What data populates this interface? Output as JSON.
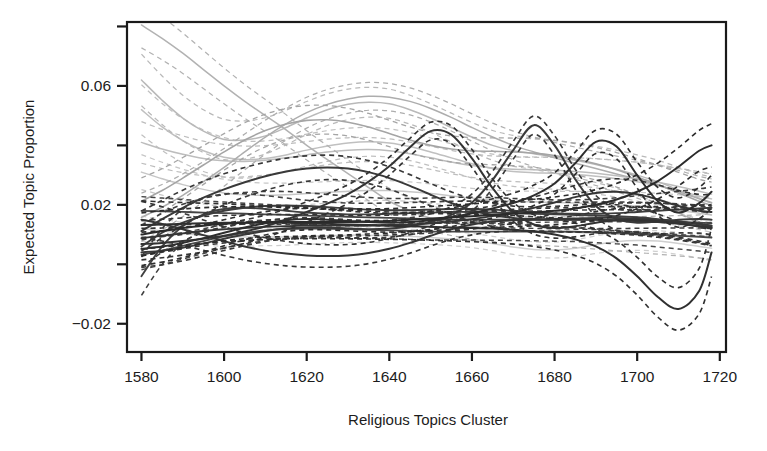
{
  "chart_data": {
    "type": "line",
    "title": "",
    "xlabel": "Religious Topics Cluster",
    "ylabel": "Expected Topic Proportion",
    "xlim": [
      1576.5,
      1721.5
    ],
    "ylim": [
      -0.0295,
      0.0815
    ],
    "grid": false,
    "legend": "none",
    "x_ticks": [
      1580,
      1600,
      1620,
      1640,
      1660,
      1680,
      1700,
      1720
    ],
    "x_tick_labels": [
      "1580",
      "1600",
      "1620",
      "1640",
      "1660",
      "1680",
      "1700",
      "1720"
    ],
    "y_ticks": [
      -0.02,
      0.0,
      0.02,
      0.04,
      0.06,
      0.08
    ],
    "y_tick_labels": [
      "-0.02",
      "",
      "0.02",
      "",
      "0.06",
      ""
    ],
    "x": [
      1580,
      1585,
      1590,
      1595,
      1600,
      1605,
      1610,
      1615,
      1620,
      1625,
      1630,
      1635,
      1640,
      1645,
      1650,
      1655,
      1660,
      1665,
      1670,
      1675,
      1680,
      1685,
      1690,
      1695,
      1700,
      1705,
      1710,
      1715,
      1718
    ],
    "ci_style": "dashed",
    "series": [
      {
        "name": "topic-1-light-declining",
        "color": "#b2b2b2",
        "width": 1.5,
        "ci_halfwidth": 0.0055,
        "values": [
          0.0805,
          0.076,
          0.071,
          0.0655,
          0.06,
          0.0548,
          0.05,
          0.0452,
          0.04,
          0.0352,
          0.0305,
          0.0258,
          0.0212,
          0.018,
          0.0155,
          0.014,
          0.0128,
          0.012,
          0.0115,
          0.0112,
          0.011,
          0.0108,
          0.0105,
          0.0102,
          0.01,
          0.0098,
          0.0096,
          0.0094,
          0.0093
        ]
      },
      {
        "name": "topic-2-light-hump",
        "color": "#b9b9b9",
        "width": 1.5,
        "ci_halfwidth": 0.0062,
        "values": [
          0.062,
          0.0552,
          0.0492,
          0.0448,
          0.042,
          0.0418,
          0.0432,
          0.046,
          0.0492,
          0.052,
          0.0538,
          0.0545,
          0.054,
          0.052,
          0.0492,
          0.046,
          0.0428,
          0.04,
          0.0382,
          0.0372,
          0.0362,
          0.035,
          0.0336,
          0.032,
          0.03,
          0.0278,
          0.025,
          0.0222,
          0.0208
        ]
      },
      {
        "name": "topic-3-light-rising",
        "color": "#adadad",
        "width": 1.5,
        "ci_halfwidth": 0.0058,
        "values": [
          0.0158,
          0.0192,
          0.0232,
          0.0278,
          0.0326,
          0.0378,
          0.0428,
          0.0472,
          0.051,
          0.0538,
          0.0556,
          0.0565,
          0.0562,
          0.0548,
          0.0524,
          0.0494,
          0.046,
          0.0428,
          0.04,
          0.0378,
          0.0358,
          0.034,
          0.0322,
          0.0304,
          0.0286,
          0.0266,
          0.0244,
          0.022,
          0.0206
        ]
      },
      {
        "name": "topic-4-light-valley",
        "color": "#c0c0c0",
        "width": 1.5,
        "ci_halfwidth": 0.006,
        "values": [
          0.052,
          0.0462,
          0.0416,
          0.0382,
          0.036,
          0.0352,
          0.0356,
          0.0368,
          0.0384,
          0.0398,
          0.0408,
          0.0412,
          0.0408,
          0.0396,
          0.0378,
          0.0358,
          0.0338,
          0.0322,
          0.0312,
          0.0308,
          0.0306,
          0.0302,
          0.0296,
          0.0288,
          0.0278,
          0.0264,
          0.0248,
          0.023,
          0.022
        ]
      },
      {
        "name": "topic-5-light-flat-low",
        "color": "#c6c6c6",
        "width": 1.5,
        "ci_halfwidth": 0.0042,
        "values": [
          0.031,
          0.0288,
          0.0268,
          0.0252,
          0.024,
          0.0234,
          0.0232,
          0.0234,
          0.0238,
          0.0242,
          0.0246,
          0.0248,
          0.0248,
          0.0244,
          0.0238,
          0.023,
          0.0222,
          0.0216,
          0.0212,
          0.021,
          0.0208,
          0.0206,
          0.0204,
          0.02,
          0.0196,
          0.019,
          0.0182,
          0.0172,
          0.0166
        ]
      },
      {
        "name": "topic-6-light-midgray-rise",
        "color": "#a5a5a5",
        "width": 1.6,
        "ci_halfwidth": 0.0056,
        "values": [
          0.0212,
          0.0248,
          0.029,
          0.0334,
          0.0378,
          0.0418,
          0.045,
          0.0472,
          0.0484,
          0.0486,
          0.0478,
          0.0462,
          0.044,
          0.0418,
          0.04,
          0.0388,
          0.0382,
          0.038,
          0.0378,
          0.0374,
          0.0366,
          0.0354,
          0.0338,
          0.0318,
          0.0294,
          0.0268,
          0.024,
          0.0212,
          0.0198
        ]
      },
      {
        "name": "topic-7-dark-peak-1652",
        "color": "#333333",
        "width": 2.0,
        "ci_halfwidth": 0.0038,
        "values": [
          0.0068,
          0.0072,
          0.0078,
          0.0086,
          0.0096,
          0.011,
          0.0128,
          0.015,
          0.0176,
          0.0204,
          0.0236,
          0.0278,
          0.033,
          0.0394,
          0.0448,
          0.0436,
          0.0356,
          0.0256,
          0.0176,
          0.0134,
          0.0122,
          0.0128,
          0.014,
          0.0148,
          0.015,
          0.0146,
          0.0138,
          0.0128,
          0.0122
        ]
      },
      {
        "name": "topic-8-dark-peak-1675",
        "color": "#3a3a3a",
        "width": 2.0,
        "ci_halfwidth": 0.0036,
        "values": [
          0.004,
          0.0046,
          0.0056,
          0.007,
          0.0086,
          0.01,
          0.0112,
          0.012,
          0.0124,
          0.0124,
          0.012,
          0.0118,
          0.012,
          0.0128,
          0.0142,
          0.0166,
          0.0208,
          0.0284,
          0.0384,
          0.0468,
          0.04,
          0.0286,
          0.0196,
          0.0152,
          0.014,
          0.0144,
          0.015,
          0.0152,
          0.015
        ]
      },
      {
        "name": "topic-9-dark-peak-1690",
        "color": "#2e2e2e",
        "width": 2.0,
        "ci_halfwidth": 0.004,
        "values": [
          0.0052,
          0.006,
          0.0072,
          0.0088,
          0.0106,
          0.0124,
          0.0138,
          0.0148,
          0.0152,
          0.015,
          0.0146,
          0.0142,
          0.014,
          0.0142,
          0.0148,
          0.0158,
          0.0172,
          0.0188,
          0.0206,
          0.0232,
          0.0272,
          0.034,
          0.0412,
          0.0396,
          0.03,
          0.0212,
          0.0174,
          0.0206,
          0.0244
        ]
      },
      {
        "name": "topic-10-dark-wave-1585",
        "color": "#404040",
        "width": 1.9,
        "ci_halfwidth": 0.0046,
        "values": [
          -0.004,
          0.006,
          0.0128,
          0.0168,
          0.0186,
          0.019,
          0.0186,
          0.018,
          0.0174,
          0.017,
          0.0168,
          0.0168,
          0.017,
          0.0172,
          0.0174,
          0.0176,
          0.0176,
          0.0174,
          0.0172,
          0.017,
          0.0168,
          0.0166,
          0.0164,
          0.0162,
          0.0158,
          0.0152,
          0.0144,
          0.0134,
          0.0128
        ]
      },
      {
        "name": "topic-11-dark-hump-1630",
        "color": "#393939",
        "width": 2.0,
        "ci_halfwidth": 0.0048,
        "values": [
          0.0112,
          0.0152,
          0.019,
          0.0224,
          0.0252,
          0.0276,
          0.0296,
          0.0312,
          0.0322,
          0.0326,
          0.0322,
          0.031,
          0.029,
          0.0264,
          0.0234,
          0.0206,
          0.0182,
          0.0166,
          0.0156,
          0.0152,
          0.0152,
          0.0154,
          0.0156,
          0.0156,
          0.0154,
          0.015,
          0.0144,
          0.0136,
          0.013
        ]
      },
      {
        "name": "topic-12-dark-dip-1630",
        "color": "#363636",
        "width": 2.0,
        "ci_halfwidth": 0.0044,
        "values": [
          0.015,
          0.0136,
          0.0118,
          0.0098,
          0.0078,
          0.006,
          0.0046,
          0.0036,
          0.003,
          0.0028,
          0.003,
          0.0038,
          0.0052,
          0.0072,
          0.0096,
          0.0118,
          0.0134,
          0.0144,
          0.0148,
          0.015,
          0.015,
          0.015,
          0.015,
          0.0148,
          0.0146,
          0.0142,
          0.0136,
          0.0128,
          0.0124
        ]
      },
      {
        "name": "topic-13-dark-flat-mid",
        "color": "#444444",
        "width": 1.8,
        "ci_halfwidth": 0.0034,
        "values": [
          0.018,
          0.0178,
          0.0176,
          0.0174,
          0.0172,
          0.017,
          0.0168,
          0.0166,
          0.0164,
          0.0162,
          0.016,
          0.0158,
          0.0156,
          0.0154,
          0.0152,
          0.015,
          0.015,
          0.015,
          0.015,
          0.015,
          0.015,
          0.015,
          0.015,
          0.0148,
          0.0146,
          0.0144,
          0.0142,
          0.014,
          0.0138
        ]
      },
      {
        "name": "topic-14-dark-rise-right",
        "color": "#2b2b2b",
        "width": 2.0,
        "ci_halfwidth": 0.0052,
        "values": [
          0.01,
          0.0112,
          0.0122,
          0.013,
          0.0136,
          0.014,
          0.0142,
          0.0142,
          0.0142,
          0.0142,
          0.0142,
          0.0144,
          0.0146,
          0.015,
          0.0154,
          0.0158,
          0.0162,
          0.0166,
          0.017,
          0.0174,
          0.018,
          0.0188,
          0.02,
          0.0218,
          0.0244,
          0.028,
          0.0328,
          0.0382,
          0.04
        ]
      },
      {
        "name": "topic-15-dark-dip-right",
        "color": "#303030",
        "width": 2.0,
        "ci_halfwidth": 0.0058,
        "values": [
          0.0132,
          0.0134,
          0.0136,
          0.0138,
          0.014,
          0.014,
          0.014,
          0.014,
          0.0138,
          0.0136,
          0.0134,
          0.0132,
          0.013,
          0.0128,
          0.0126,
          0.0124,
          0.0122,
          0.012,
          0.0116,
          0.011,
          0.01,
          0.0084,
          0.006,
          0.002,
          -0.004,
          -0.011,
          -0.015,
          -0.009,
          0.004
        ]
      },
      {
        "name": "topic-16-dark-lowflat",
        "color": "#484848",
        "width": 1.8,
        "ci_halfwidth": 0.0036,
        "values": [
          0.0032,
          0.0046,
          0.0062,
          0.0078,
          0.0094,
          0.0106,
          0.0114,
          0.0118,
          0.012,
          0.012,
          0.0118,
          0.0116,
          0.0114,
          0.0112,
          0.011,
          0.011,
          0.011,
          0.011,
          0.011,
          0.011,
          0.011,
          0.011,
          0.0108,
          0.0106,
          0.0104,
          0.01,
          0.0096,
          0.0092,
          0.009
        ]
      },
      {
        "name": "topic-17-lightgray-zero",
        "color": "#cfcfcf",
        "width": 1.5,
        "ci_halfwidth": 0.003,
        "values": [
          0.012,
          0.0112,
          0.0104,
          0.0098,
          0.0094,
          0.0092,
          0.0092,
          0.0092,
          0.0094,
          0.0096,
          0.0098,
          0.0098,
          0.0096,
          0.0094,
          0.009,
          0.0086,
          0.008,
          0.007,
          0.0058,
          0.005,
          0.0048,
          0.0054,
          0.0066,
          0.0076,
          0.008,
          0.0078,
          0.007,
          0.006,
          0.0054
        ]
      },
      {
        "name": "topic-18-dark-early-dip",
        "color": "#3d3d3d",
        "width": 1.9,
        "ci_halfwidth": 0.005,
        "values": [
          0.006,
          0.0106,
          0.014,
          0.0164,
          0.018,
          0.019,
          0.0196,
          0.0198,
          0.0196,
          0.0192,
          0.0188,
          0.0184,
          0.0182,
          0.0182,
          0.0184,
          0.0186,
          0.0186,
          0.0184,
          0.018,
          0.0176,
          0.0172,
          0.017,
          0.017,
          0.0172,
          0.0176,
          0.018,
          0.0184,
          0.0188,
          0.019
        ]
      },
      {
        "name": "topic-19-light-flat-high",
        "color": "#bdbdbd",
        "width": 1.5,
        "ci_halfwidth": 0.005,
        "values": [
          0.041,
          0.0388,
          0.037,
          0.0356,
          0.0348,
          0.0346,
          0.035,
          0.0358,
          0.0368,
          0.0378,
          0.0384,
          0.0386,
          0.0382,
          0.0372,
          0.0358,
          0.0344,
          0.0332,
          0.0324,
          0.032,
          0.0318,
          0.0316,
          0.0312,
          0.0306,
          0.0298,
          0.0288,
          0.0276,
          0.0262,
          0.0246,
          0.0236
        ]
      },
      {
        "name": "topic-20-dark-zigzag-right",
        "color": "#353535",
        "width": 1.9,
        "ci_halfwidth": 0.0042,
        "values": [
          0.0088,
          0.0096,
          0.0104,
          0.0112,
          0.0118,
          0.0122,
          0.0126,
          0.0128,
          0.013,
          0.013,
          0.013,
          0.013,
          0.0132,
          0.0134,
          0.0138,
          0.0144,
          0.0152,
          0.0162,
          0.0174,
          0.019,
          0.0208,
          0.0226,
          0.024,
          0.0244,
          0.0236,
          0.0218,
          0.0196,
          0.018,
          0.0176
        ]
      }
    ]
  },
  "axis": {
    "ylabel": "Expected Topic Proportion",
    "xlabel": "Religious Topics Cluster"
  }
}
